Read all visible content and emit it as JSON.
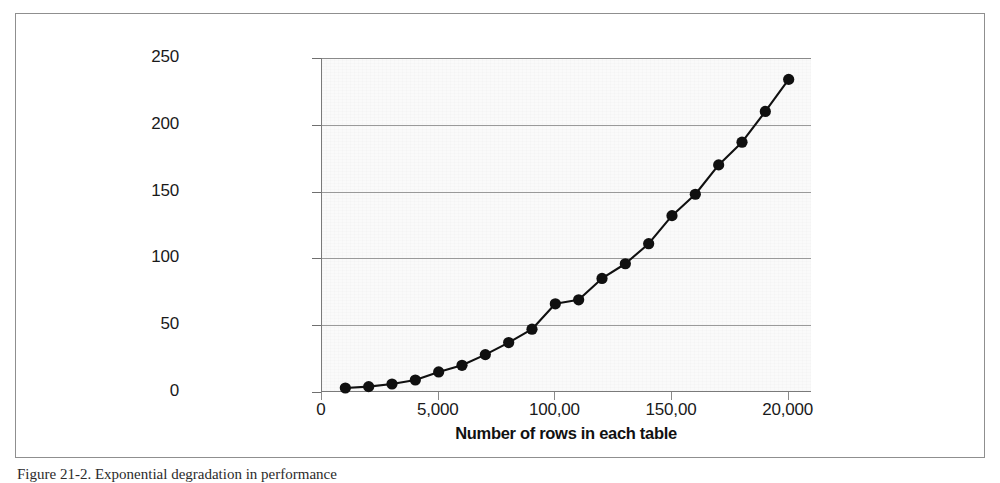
{
  "figure": {
    "caption": "Figure 21-2. Exponential degradation in performance"
  },
  "chart_data": {
    "type": "line",
    "title": "",
    "xlabel": "Number of rows in each table",
    "ylabel": "Elapsed time (seconds)",
    "xlim": [
      0,
      21000
    ],
    "ylim": [
      0,
      250
    ],
    "grid": true,
    "legend": "none",
    "marker": "filled-circle",
    "line_color": "#101010",
    "plot_background": "#fafafa",
    "x_tick_labels": [
      "0",
      "5,000",
      "100,00",
      "150,00",
      "20,000"
    ],
    "x_tick_values": [
      0,
      5000,
      10000,
      15000,
      20000
    ],
    "y_tick_labels": [
      "0",
      "50",
      "100",
      "150",
      "200",
      "250"
    ],
    "y_tick_values": [
      0,
      50,
      100,
      150,
      200,
      250
    ],
    "x": [
      1000,
      2000,
      3000,
      4000,
      5000,
      6000,
      7000,
      8000,
      9000,
      10000,
      11000,
      12000,
      13000,
      14000,
      15000,
      16000,
      17000,
      18000,
      19000,
      20000
    ],
    "values": [
      3,
      4,
      6,
      9,
      15,
      20,
      28,
      37,
      47,
      66,
      69,
      85,
      96,
      111,
      132,
      148,
      170,
      187,
      210,
      234
    ],
    "series": [
      {
        "name": "Elapsed time",
        "values": [
          3,
          4,
          6,
          9,
          15,
          20,
          28,
          37,
          47,
          66,
          69,
          85,
          96,
          111,
          132,
          148,
          170,
          187,
          210,
          234
        ]
      }
    ]
  }
}
